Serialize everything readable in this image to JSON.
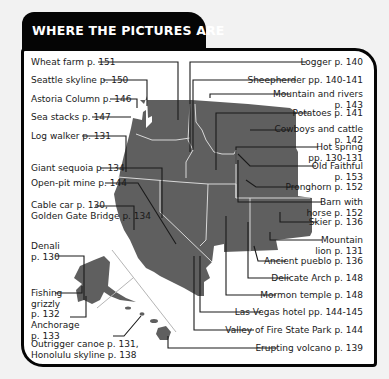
{
  "header": {
    "title": "WHERE THE PICTURES ARE"
  },
  "colors": {
    "header_bg": "#050505",
    "land": "#5f5f5f",
    "border": "#050505",
    "panel": "#ffffff"
  },
  "labels_left": [
    {
      "id": "wheat-farm",
      "text": "Wheat farm p. 151"
    },
    {
      "id": "seattle-skyline",
      "text": "Seattle skyline p. 150"
    },
    {
      "id": "astoria-column",
      "text": "Astoria Column p. 146"
    },
    {
      "id": "sea-stacks",
      "text": "Sea stacks p. 147"
    },
    {
      "id": "log-walker",
      "text": "Log walker p. 131"
    },
    {
      "id": "giant-sequoia",
      "text": "Giant sequoia p. 134"
    },
    {
      "id": "open-pit-mine",
      "text": "Open-pit mine p. 144"
    },
    {
      "id": "cable-car",
      "line1": "Cable car p. 130,",
      "line2": "Golden Gate Bridge p. 134"
    },
    {
      "id": "denali",
      "line1": "Denali",
      "line2": "p. 130"
    },
    {
      "id": "fishing-grizzly",
      "line1": "Fishing",
      "line2": "grizzly",
      "line3": "p. 132"
    },
    {
      "id": "anchorage",
      "line1": "Anchorage",
      "line2": "p. 133"
    },
    {
      "id": "outrigger-canoe",
      "line1": "Outrigger canoe p. 131,",
      "line2": "Honolulu skyline p. 138"
    }
  ],
  "labels_right": [
    {
      "id": "logger",
      "text": "Logger p. 140"
    },
    {
      "id": "sheepherder",
      "text": "Sheepherder pp. 140-141"
    },
    {
      "id": "mountain-rivers",
      "line1": "Mountain and rivers",
      "line2": "p. 143"
    },
    {
      "id": "potatoes",
      "text": "Potatoes p. 141"
    },
    {
      "id": "cowboys-cattle",
      "line1": "Cowboys and cattle",
      "line2": "p. 142"
    },
    {
      "id": "hot-spring",
      "line1": "Hot spring",
      "line2": "pp. 130-131"
    },
    {
      "id": "old-faithful",
      "line1": "Old Faithful",
      "line2": "p. 153"
    },
    {
      "id": "pronghorn",
      "text": "Pronghorn p. 152"
    },
    {
      "id": "barn-horse",
      "line1": "Barn with",
      "line2": "horse p. 152"
    },
    {
      "id": "skier",
      "text": "Skier p. 136"
    },
    {
      "id": "mountain-lion",
      "line1": "Mountain",
      "line2": "lion p. 131"
    },
    {
      "id": "ancient-pueblo",
      "text": "Ancient pueblo p. 136"
    },
    {
      "id": "delicate-arch",
      "text": "Delicate Arch p. 148"
    },
    {
      "id": "mormon-temple",
      "text": "Mormon temple p. 148"
    },
    {
      "id": "las-vegas-hotel",
      "text": "Las Vegas hotel pp. 144-145"
    },
    {
      "id": "valley-of-fire",
      "text": "Valley of Fire State Park p. 144"
    },
    {
      "id": "erupting-volcano",
      "text": "Erupting volcano p. 139"
    }
  ]
}
